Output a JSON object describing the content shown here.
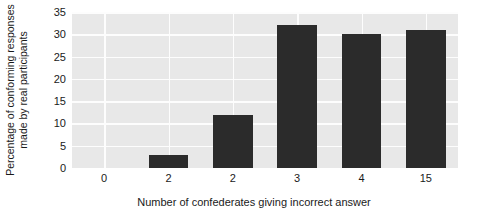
{
  "chart_data": {
    "type": "bar",
    "title": "",
    "categories": [
      "0",
      "2",
      "2",
      "3",
      "4",
      "15"
    ],
    "values": [
      0,
      3,
      12,
      32,
      30,
      31
    ],
    "series": [
      {
        "name": "Percentage of conforming responses made by real participants",
        "values": [
          0,
          3,
          12,
          32,
          30,
          31
        ]
      }
    ],
    "xlabel": "Number of confederates giving incorrect answer",
    "ylabel": "Percentage of conforming responses made by real participants",
    "ylabel_lines": [
      "Percentage of conforming responses",
      "made by real participants"
    ],
    "ylim": [
      0,
      35
    ],
    "yticks": [
      0,
      5,
      10,
      15,
      20,
      25,
      30,
      35
    ],
    "ytick_labels": [
      "0",
      "5",
      "10",
      "15",
      "20",
      "25",
      "30",
      "35"
    ],
    "grid": true,
    "grid_axis": "both",
    "legend": false,
    "legend_position": "none",
    "colors": {
      "bar": "#2b2b2b",
      "plot_background": "#e8e8e8",
      "gridline": "#fdfdfd",
      "figure_background": "#ffffff",
      "text": "#1a1a1a"
    }
  }
}
